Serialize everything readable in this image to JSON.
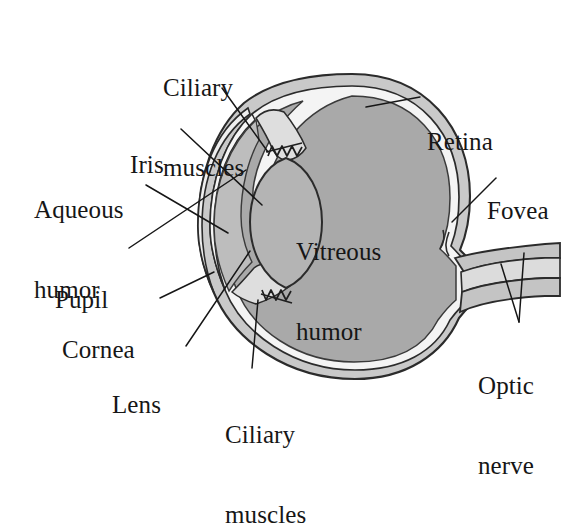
{
  "diagram": {
    "type": "anatomical-cross-section",
    "background_color": "#ffffff",
    "ink_color": "#161616"
  },
  "labels": {
    "ciliary_muscles_top": {
      "line1": "Ciliary",
      "line2": "muscles"
    },
    "iris": {
      "line1": "Iris"
    },
    "aqueous_humor": {
      "line1": "Aqueous",
      "line2": "humor"
    },
    "pupil": {
      "line1": "Pupil"
    },
    "cornea": {
      "line1": "Cornea"
    },
    "lens": {
      "line1": "Lens"
    },
    "ciliary_muscles_bottom": {
      "line1": "Ciliary",
      "line2": "muscles"
    },
    "vitreous_humor": {
      "line1": "Vitreous",
      "line2": "humor"
    },
    "retina": {
      "line1": "Retina"
    },
    "fovea": {
      "line1": "Fovea"
    },
    "optic_nerve": {
      "line1": "Optic",
      "line2": "nerve"
    }
  },
  "structures": {
    "sclera": {
      "name": "sclera",
      "fill": "#c9c9c9"
    },
    "retina_layer": {
      "name": "retina",
      "fill": "#f2f2f2"
    },
    "vitreous_body": {
      "name": "vitreous humor",
      "fill": "#a9a9a9"
    },
    "anterior_chamber": {
      "name": "aqueous humor",
      "fill": "#bdbdbd"
    },
    "cornea_layer": {
      "name": "cornea",
      "fill": "#efefef"
    },
    "lens_body": {
      "name": "lens",
      "fill": "#b4b4b4"
    },
    "ciliary_body": {
      "name": "ciliary muscles",
      "fill": "#dcdcdc"
    },
    "optic_nerve_bundle": {
      "name": "optic nerve",
      "fill": "#c4c4c4"
    }
  }
}
